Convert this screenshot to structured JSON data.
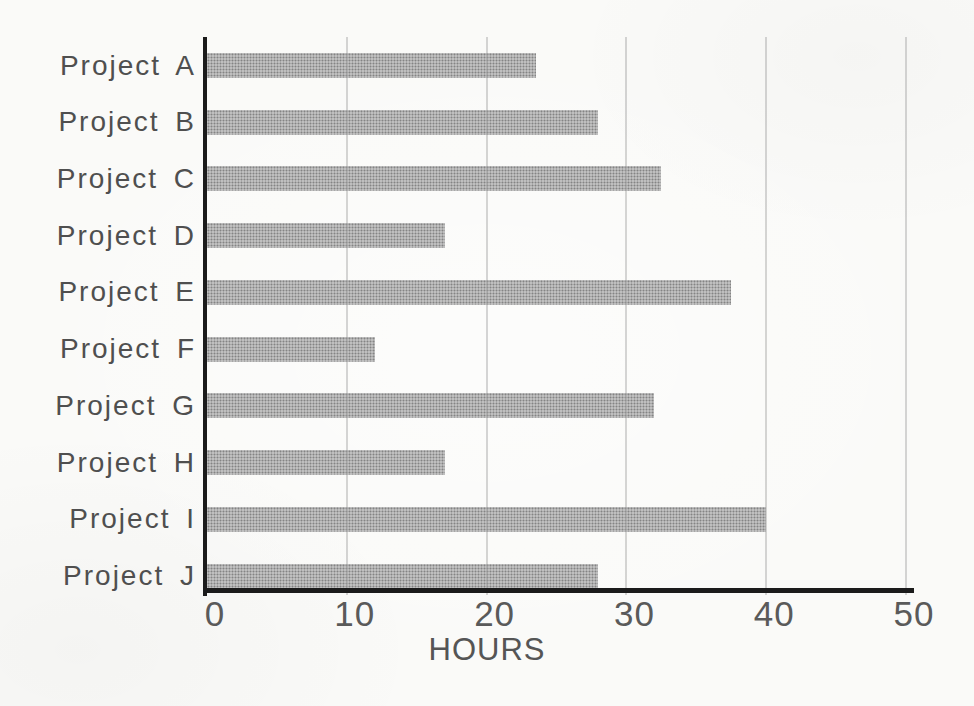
{
  "figure": {
    "canvas": {
      "width": 974,
      "height": 706
    },
    "style": "scanned grayscale textbook bar graph",
    "colors": {
      "background": "#fafaf8",
      "bar_fill": "#aeaeae",
      "axis_line": "#1b1b1b",
      "gridline": "#a0a0a0",
      "category_text": "#4f4f4f",
      "tick_text": "#5a5a5a"
    }
  },
  "chart_data": {
    "type": "bar",
    "orientation": "horizontal",
    "title": "",
    "xlabel": "HOURS",
    "ylabel": "",
    "categories": [
      "Project A",
      "Project B",
      "Project C",
      "Project D",
      "Project E",
      "Project F",
      "Project G",
      "Project H",
      "Project I",
      "Project J"
    ],
    "values": [
      23.5,
      28,
      32.5,
      17,
      37.5,
      12,
      32,
      17,
      40,
      28
    ],
    "xlim": [
      0,
      50
    ],
    "x_ticks": [
      "0",
      "10",
      "20",
      "30",
      "40",
      "50"
    ],
    "x_tick_interval": 10,
    "grid": "vertical gridlines at each x tick, drawn over bars",
    "legend": false,
    "units": "hours"
  }
}
